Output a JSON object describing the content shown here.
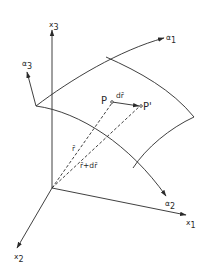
{
  "figure": {
    "colors": {
      "line": "#2a2a2a",
      "background": "#ffffff"
    }
  },
  "axes": {
    "x1": {
      "base": "x",
      "sub": "1"
    },
    "x2": {
      "base": "x",
      "sub": "2"
    },
    "x3": {
      "base": "x",
      "sub": "3"
    }
  },
  "curvilinear": {
    "alpha1": {
      "base": "α",
      "sub": "1"
    },
    "alpha2": {
      "base": "α",
      "sub": "2"
    },
    "alpha3": {
      "base": "α",
      "sub": "3"
    }
  },
  "points": {
    "P": "P",
    "P_prime": "P'"
  },
  "vectors": {
    "dr": "dr̄",
    "r": "r̄",
    "r_plus_dr": "r̄+dr̄"
  }
}
